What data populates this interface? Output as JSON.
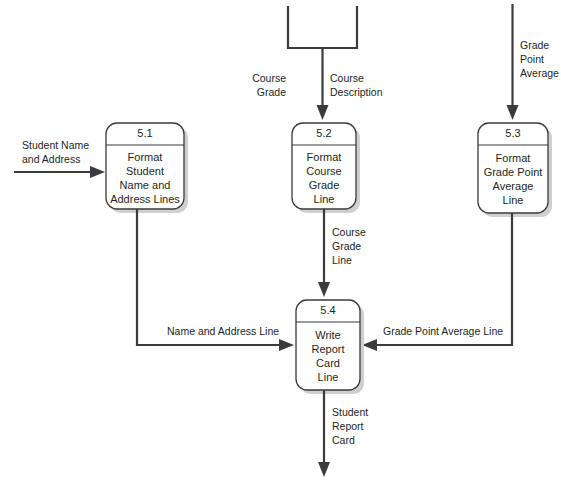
{
  "diagram": {
    "colors": {
      "line": "#3b3b3f",
      "text": "#231f20",
      "background": "#ffffff",
      "shadow": "#cfcfd2"
    },
    "processes": [
      {
        "id": "5.1",
        "number": "5.1",
        "lines": [
          "Format",
          "Student",
          "Name and",
          "Address Lines"
        ]
      },
      {
        "id": "5.2",
        "number": "5.2",
        "lines": [
          "Format",
          "Course",
          "Grade",
          "Line"
        ]
      },
      {
        "id": "5.3",
        "number": "5.3",
        "lines": [
          "Format",
          "Grade Point",
          "Average",
          "Line"
        ]
      },
      {
        "id": "5.4",
        "number": "5.4",
        "lines": [
          "Write",
          "Report",
          "Card",
          "Line"
        ]
      }
    ],
    "flows": [
      {
        "id": "student-name-and-address",
        "lines": [
          "Student Name",
          "and Address"
        ]
      },
      {
        "id": "course-grade",
        "lines": [
          "Course",
          "Grade"
        ]
      },
      {
        "id": "course-description",
        "lines": [
          "Course",
          "Description"
        ]
      },
      {
        "id": "grade-point-average",
        "lines": [
          "Grade",
          "Point",
          "Average"
        ]
      },
      {
        "id": "course-grade-line",
        "lines": [
          "Course",
          "Grade",
          "Line"
        ]
      },
      {
        "id": "name-and-address-line",
        "lines": [
          "Name and Address Line"
        ]
      },
      {
        "id": "grade-point-average-line",
        "lines": [
          "Grade Point Average  Line"
        ]
      },
      {
        "id": "student-report-card",
        "lines": [
          "Student",
          "Report",
          "Card"
        ]
      }
    ]
  }
}
